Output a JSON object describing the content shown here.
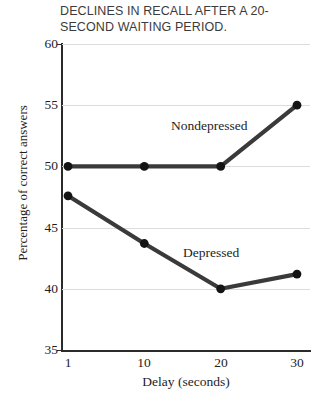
{
  "chart_data": {
    "type": "line",
    "title": "DECLINES IN RECALL AFTER A 20-\nSECOND WAITING PERIOD.",
    "xlabel": "Delay (seconds)",
    "ylabel": "Percentage of correct answers",
    "categories": [
      "1",
      "10",
      "20",
      "30"
    ],
    "x_tick_labels": [
      "1",
      "10",
      "20",
      "30"
    ],
    "y_tick_labels": [
      "60",
      "55",
      "50",
      "45",
      "40",
      "35"
    ],
    "y_ticks": [
      60,
      55,
      50,
      45,
      40,
      35
    ],
    "ylim": [
      35,
      60
    ],
    "grid": true,
    "legend_position": "inline-annotation",
    "series": [
      {
        "name": "Nondepressed",
        "label": "Nondepressed",
        "color": "#3a3a3a",
        "values": [
          50.0,
          50.0,
          50.0,
          55.0
        ]
      },
      {
        "name": "Depressed",
        "label": "Depressed",
        "color": "#3a3a3a",
        "values": [
          47.6,
          43.7,
          40.0,
          41.2
        ]
      }
    ]
  },
  "colors": {
    "line": "#3a3a3a",
    "marker": "#141414",
    "axis": "#2b2b2b",
    "grid": "#dcdcdc",
    "title_text": "#3b3b3b",
    "label_text": "#1d1d1d",
    "background": "#ffffff"
  }
}
